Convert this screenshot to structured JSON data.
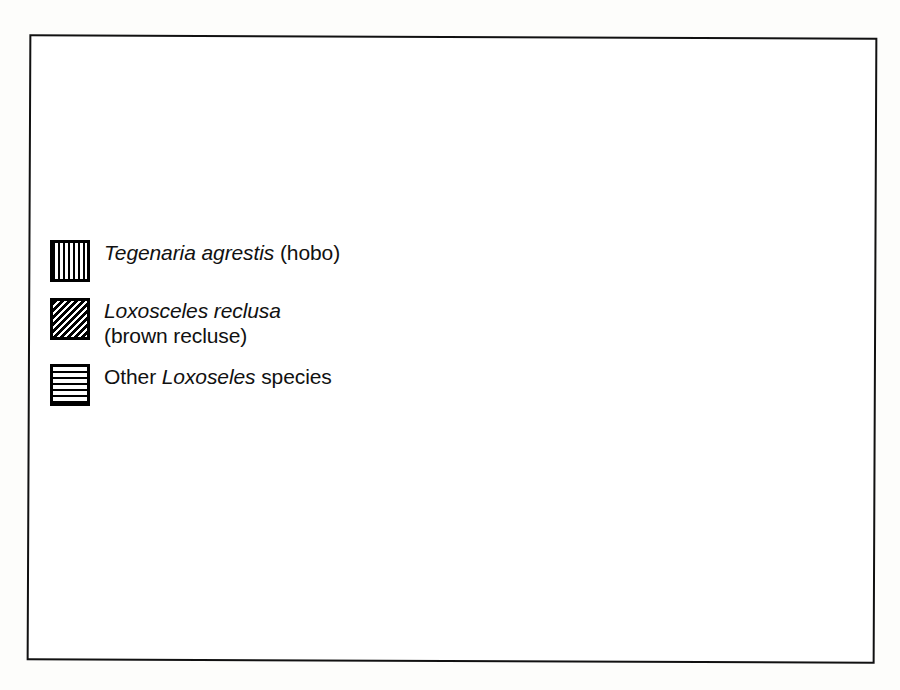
{
  "figure": {
    "kind": "distribution-map",
    "region": "North America",
    "frame_border_color": "#111111",
    "background_color": "#ffffff",
    "ink_color": "#000000"
  },
  "legend": {
    "items": [
      {
        "id": "tegenaria-agrestis",
        "pattern": "vertical-lines",
        "pattern_name": "vertical hatch",
        "scientific_name": "Tegenaria agrestis",
        "common_name": "(hobo)",
        "line2": ""
      },
      {
        "id": "loxosceles-reclusa",
        "pattern": "diagonal-lines",
        "pattern_name": "diagonal hatch",
        "scientific_name": "Loxosceles reclusa",
        "common_name": "",
        "line2": "(brown recluse)"
      },
      {
        "id": "other-loxoseles",
        "pattern": "horizontal-lines",
        "pattern_name": "horizontal hatch",
        "prefix": "Other ",
        "scientific_name": "Loxoseles",
        "common_name": " species",
        "line2": ""
      }
    ]
  },
  "map_regions": [
    {
      "name": "Pacific Northwest hobo spider range",
      "pattern": "vertical-lines",
      "states": [
        "Washington",
        "Oregon",
        "Idaho",
        "western Montana",
        "northern Nevada",
        "northern Utah"
      ]
    },
    {
      "name": "Brown recluse range",
      "pattern": "diagonal-lines",
      "states": [
        "Missouri",
        "Arkansas",
        "Kansas",
        "Oklahoma",
        "Tennessee",
        "Kentucky",
        "Mississippi",
        "Alabama",
        "Louisiana",
        "Illinois",
        "Indiana",
        "Ohio",
        "Georgia",
        "Iowa",
        "Nebraska"
      ]
    },
    {
      "name": "Other Loxosceles species range",
      "pattern": "horizontal-lines",
      "states": [
        "California",
        "Nevada",
        "Arizona",
        "New Mexico",
        "Texas",
        "southern Utah"
      ]
    }
  ]
}
